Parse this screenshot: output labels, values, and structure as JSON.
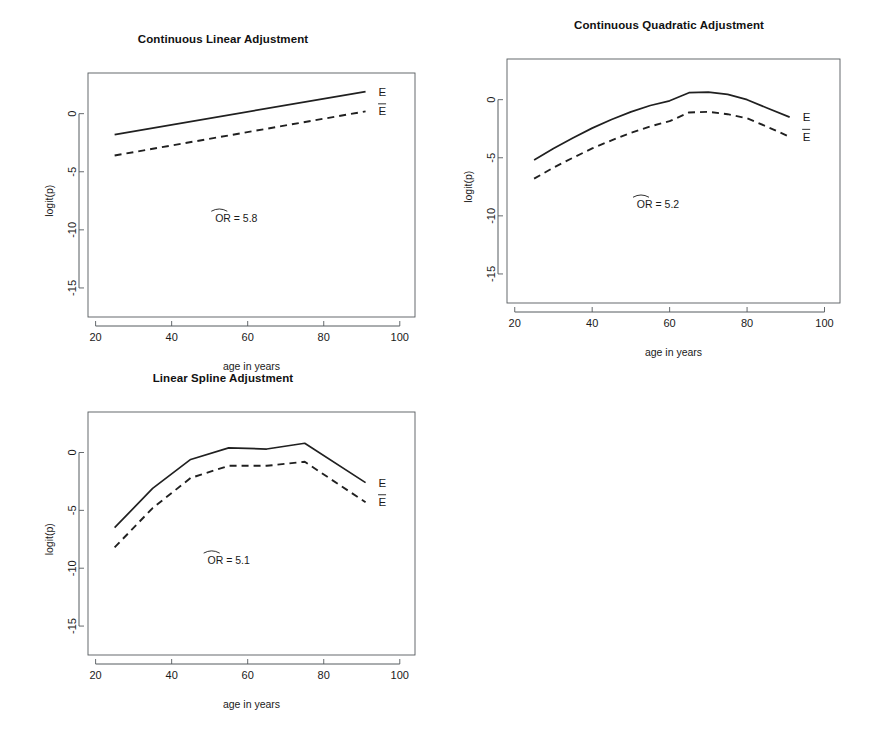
{
  "figure": {
    "width": 892,
    "height": 735,
    "background": "#ffffff",
    "line_color": "#202020",
    "axis_color": "#555a5e"
  },
  "chart_data": [
    {
      "type": "line",
      "panel_index": 0,
      "title": "Continuous Linear Adjustment",
      "xlabel": "age in years",
      "ylabel": "logit(p)",
      "xlim": [
        18,
        104
      ],
      "ylim": [
        -17.5,
        3.5
      ],
      "xticks": [
        20,
        40,
        60,
        80,
        100
      ],
      "xtick_labels": [
        "20",
        "40",
        "60",
        "80",
        "100"
      ],
      "yticks": [
        0,
        -5,
        -10,
        -15
      ],
      "ytick_labels": [
        "0",
        "-5",
        "-10",
        "-15"
      ],
      "grid": false,
      "legend_position": "right-inline",
      "annotation": "OR = 5.8",
      "annotation_value": 5.8,
      "annotation_prefix": "OR",
      "annotation_has_hat": true,
      "annotation_x": 57,
      "annotation_y": -9.0,
      "series": [
        {
          "name": "E",
          "style": "solid",
          "label": "E",
          "label_overbar": false,
          "x": [
            25,
            91
          ],
          "values": [
            -1.8,
            1.9
          ]
        },
        {
          "name": "E-bar",
          "style": "dashed",
          "label": "E",
          "label_overbar": true,
          "x": [
            25,
            91
          ],
          "values": [
            -3.6,
            0.2
          ]
        }
      ]
    },
    {
      "type": "line",
      "panel_index": 1,
      "title": "Continuous Quadratic Adjustment",
      "xlabel": "age in years",
      "ylabel": "logit(p)",
      "xlim": [
        18,
        104
      ],
      "ylim": [
        -17.5,
        3.5
      ],
      "xticks": [
        20,
        40,
        60,
        80,
        100
      ],
      "xtick_labels": [
        "20",
        "40",
        "60",
        "80",
        "100"
      ],
      "yticks": [
        0,
        -5,
        -10,
        -15
      ],
      "ytick_labels": [
        "0",
        "-5",
        "-10",
        "-15"
      ],
      "grid": false,
      "legend_position": "right-inline",
      "annotation": "OR = 5.2",
      "annotation_value": 5.2,
      "annotation_prefix": "OR",
      "annotation_has_hat": true,
      "annotation_x": 57,
      "annotation_y": -9.0,
      "series": [
        {
          "name": "E",
          "style": "solid",
          "label": "E",
          "label_overbar": false,
          "x": [
            25,
            30,
            35,
            40,
            45,
            50,
            55,
            60,
            65,
            70,
            75,
            80,
            85,
            91
          ],
          "values": [
            -5.2,
            -4.2,
            -3.3,
            -2.45,
            -1.7,
            -1.05,
            -0.5,
            -0.1,
            0.6,
            0.65,
            0.45,
            0.0,
            -0.7,
            -1.5
          ]
        },
        {
          "name": "E-bar",
          "style": "dashed",
          "label": "E",
          "label_overbar": true,
          "x": [
            25,
            30,
            35,
            40,
            45,
            50,
            55,
            60,
            65,
            70,
            75,
            80,
            85,
            91
          ],
          "values": [
            -6.8,
            -5.85,
            -5.0,
            -4.2,
            -3.5,
            -2.85,
            -2.3,
            -1.85,
            -1.1,
            -1.05,
            -1.25,
            -1.6,
            -2.3,
            -3.2
          ]
        }
      ]
    },
    {
      "type": "line",
      "panel_index": 2,
      "title": "Linear Spline Adjustment",
      "xlabel": "age in years",
      "ylabel": "logit(p)",
      "xlim": [
        18,
        104
      ],
      "ylim": [
        -17.5,
        3.5
      ],
      "xticks": [
        20,
        40,
        60,
        80,
        100
      ],
      "xtick_labels": [
        "20",
        "40",
        "60",
        "80",
        "100"
      ],
      "yticks": [
        0,
        -5,
        -10,
        -15
      ],
      "ytick_labels": [
        "0",
        "-5",
        "-10",
        "-15"
      ],
      "grid": false,
      "legend_position": "right-inline",
      "annotation": "OR = 5.1",
      "annotation_value": 5.1,
      "annotation_prefix": "OR",
      "annotation_has_hat": true,
      "annotation_x": 55,
      "annotation_y": -9.3,
      "knots": [
        35,
        45,
        55,
        65,
        75
      ],
      "series": [
        {
          "name": "E",
          "style": "solid",
          "label": "E",
          "label_overbar": false,
          "x": [
            25,
            35,
            45,
            55,
            65,
            75,
            91
          ],
          "values": [
            -6.5,
            -3.1,
            -0.6,
            0.4,
            0.3,
            0.8,
            -2.6
          ]
        },
        {
          "name": "E-bar",
          "style": "dashed",
          "label": "E",
          "label_overbar": true,
          "x": [
            25,
            35,
            45,
            55,
            65,
            75,
            91
          ],
          "values": [
            -8.2,
            -4.8,
            -2.2,
            -1.15,
            -1.15,
            -0.8,
            -4.3
          ]
        }
      ]
    }
  ],
  "panels": [
    {
      "name": "continuous-linear-adjustment",
      "left": 0,
      "top": 14,
      "width": 446,
      "height": 360,
      "plot": {
        "x0": 88,
        "y0": 59,
        "x1": 415,
        "y1": 303
      }
    },
    {
      "name": "continuous-quadratic-adjustment",
      "left": 446,
      "top": 14,
      "width": 446,
      "height": 360,
      "plot": {
        "x0": 61,
        "y0": 45,
        "x1": 394,
        "y1": 289
      }
    },
    {
      "name": "linear-spline-adjustment",
      "left": 0,
      "top": 367,
      "width": 446,
      "height": 368,
      "plot": {
        "x0": 88,
        "y0": 45,
        "x1": 415,
        "y1": 288
      }
    }
  ]
}
